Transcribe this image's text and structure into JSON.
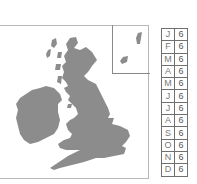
{
  "map": {
    "region": "British Isles",
    "land_color": "#8c8c8c",
    "frame_color": "#b8b8b8",
    "inset_label": "Shetland inset"
  },
  "table": {
    "rows": [
      {
        "month": "J",
        "value": "6"
      },
      {
        "month": "F",
        "value": "6"
      },
      {
        "month": "M",
        "value": "6"
      },
      {
        "month": "A",
        "value": "6"
      },
      {
        "month": "M",
        "value": "6"
      },
      {
        "month": "J",
        "value": "6"
      },
      {
        "month": "J",
        "value": "6"
      },
      {
        "month": "A",
        "value": "6"
      },
      {
        "month": "S",
        "value": "6"
      },
      {
        "month": "O",
        "value": "6"
      },
      {
        "month": "N",
        "value": "6"
      },
      {
        "month": "D",
        "value": "6"
      }
    ]
  }
}
